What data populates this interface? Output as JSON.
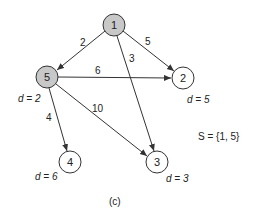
{
  "diagram": {
    "caption": "(c)",
    "set_label": "S = {1, 5}",
    "nodes": [
      {
        "id": "1",
        "x": 114,
        "y": 25,
        "visited": true,
        "dist_label": ""
      },
      {
        "id": "5",
        "x": 47,
        "y": 77,
        "visited": true,
        "dist_label": "d = 2"
      },
      {
        "id": "2",
        "x": 183,
        "y": 78,
        "visited": false,
        "dist_label": "d = 5"
      },
      {
        "id": "4",
        "x": 70,
        "y": 162,
        "visited": false,
        "dist_label": "d = 6"
      },
      {
        "id": "3",
        "x": 157,
        "y": 162,
        "visited": false,
        "dist_label": "d = 3"
      }
    ],
    "edges": [
      {
        "from": "1",
        "to": "5",
        "weight": "2"
      },
      {
        "from": "1",
        "to": "2",
        "weight": "5"
      },
      {
        "from": "1",
        "to": "3",
        "weight": "3"
      },
      {
        "from": "5",
        "to": "2",
        "weight": "6"
      },
      {
        "from": "5",
        "to": "3",
        "weight": "10"
      },
      {
        "from": "5",
        "to": "4",
        "weight": "4"
      }
    ],
    "colors": {
      "visited_fill": "#c8c8c8",
      "unvisited_fill": "#ffffff",
      "stroke": "#333333"
    }
  }
}
